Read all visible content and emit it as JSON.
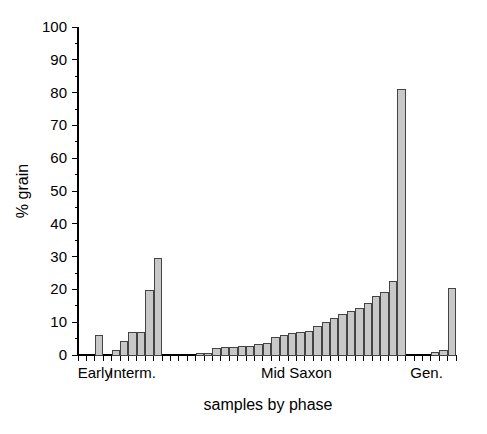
{
  "chart_data": {
    "type": "bar",
    "title": "",
    "xlabel": "samples by phase",
    "ylabel": "% grain",
    "ylim": [
      0,
      100
    ],
    "xlim": [
      0,
      45
    ],
    "grid": false,
    "legend": null,
    "y_ticks": [
      0,
      10,
      20,
      30,
      40,
      50,
      60,
      70,
      80,
      90,
      100
    ],
    "y_tick_labels": [
      "0",
      "10",
      "20",
      "30",
      "40",
      "50",
      "60",
      "70",
      "80",
      "90",
      "100"
    ],
    "y_minor_tick_step": 5,
    "category_labels": [
      "Early",
      "Interm.",
      "Mid Saxon",
      "Gen."
    ],
    "category_label_positions": [
      2.0,
      6.5,
      26.0,
      41.5
    ],
    "bar_color": "#c8c8c8",
    "bar_edge_color": "#444444",
    "axis_color": "#000000",
    "background_color": "#ffffff",
    "n_slots": 45,
    "categories": [
      "1",
      "2",
      "3",
      "4",
      "5",
      "6",
      "7",
      "8",
      "9",
      "10",
      "11",
      "12",
      "13",
      "14",
      "15",
      "16",
      "17",
      "18",
      "19",
      "20",
      "21",
      "22",
      "23",
      "24",
      "25",
      "26",
      "27",
      "28",
      "29",
      "30",
      "31",
      "32",
      "33",
      "34",
      "35",
      "36",
      "37",
      "38",
      "39",
      "40",
      "41",
      "42",
      "43",
      "44",
      "45"
    ],
    "values": [
      0,
      0,
      5.8,
      0,
      1.4,
      4.2,
      7.0,
      7.0,
      19.6,
      29.4,
      0,
      0,
      0,
      0,
      0.4,
      0.6,
      2.0,
      2.2,
      2.4,
      2.6,
      2.7,
      3.2,
      3.4,
      5.3,
      6.0,
      6.7,
      7.0,
      7.2,
      8.6,
      9.9,
      11.1,
      12.4,
      13.4,
      14.2,
      15.8,
      17.7,
      19.1,
      22.5,
      81.0,
      0,
      0,
      0,
      0.7,
      1.5,
      20.3
    ]
  }
}
